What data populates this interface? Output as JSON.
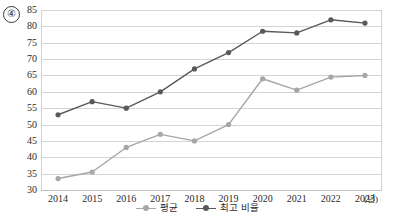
{
  "item_number": "④",
  "chart_data": {
    "type": "line",
    "title": "",
    "subtitle": "",
    "xlabel": "(년)",
    "ylabel": "",
    "categories": [
      "2014",
      "2015",
      "2016",
      "2017",
      "2018",
      "2019",
      "2020",
      "2021",
      "2022",
      "2023"
    ],
    "ylim": [
      30,
      85
    ],
    "ytick_step": 5,
    "yticks": [
      "85",
      "80",
      "75",
      "70",
      "65",
      "60",
      "55",
      "50",
      "45",
      "40",
      "35",
      "30"
    ],
    "grid": true,
    "legend_position": "bottom-center",
    "series": [
      {
        "name": "평균",
        "color": "#a6a6a6",
        "marker": "circle",
        "values": [
          33.5,
          35.5,
          43,
          47,
          45,
          50,
          64,
          60.5,
          64.5,
          65
        ]
      },
      {
        "name": "최고 비율",
        "color": "#595959",
        "marker": "circle",
        "values": [
          53,
          57,
          55,
          60,
          67,
          72,
          78.5,
          78,
          82,
          81
        ]
      }
    ]
  },
  "legend": {
    "entries": [
      {
        "label": "평균",
        "color": "#a6a6a6"
      },
      {
        "label": "최고 비율",
        "color": "#595959"
      }
    ]
  },
  "axis": {
    "x_unit_label": "(년)"
  }
}
